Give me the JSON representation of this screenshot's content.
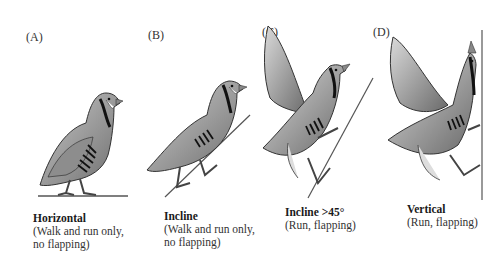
{
  "figure": {
    "panels": [
      {
        "label": "(A)",
        "title": "Horizontal",
        "desc_line1": "(Walk and run only,",
        "desc_line2": "no flapping)"
      },
      {
        "label": "(B)",
        "title": "Incline",
        "desc_line1": "(Walk and run only,",
        "desc_line2": "no flapping)"
      },
      {
        "label": "(C)",
        "title": "Incline >45°",
        "desc_line1": "(Run, flapping)",
        "desc_line2": ""
      },
      {
        "label": "(D)",
        "title": "Vertical",
        "desc_line1": "(Run, flapping)",
        "desc_line2": ""
      }
    ],
    "colors": {
      "bird_body": "#9a9a9a",
      "bird_light": "#e8e8e8",
      "outline": "#3a3a3a",
      "stripe": "#111111",
      "surface": "#555555"
    }
  }
}
